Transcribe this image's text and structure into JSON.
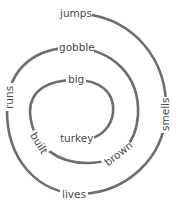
{
  "diagram": {
    "type": "word-spiral",
    "line_color": "#6e6e6e",
    "text_color": "#4a4a4a",
    "words_outer_to_inner": [
      "jumps",
      "smells",
      "lives",
      "runs",
      "gobble",
      "brown",
      "built",
      "big",
      "turkey"
    ],
    "labels": {
      "jumps": "jumps",
      "smells": "smells",
      "lives": "lives",
      "runs": "runs",
      "gobble": "gobble",
      "brown": "brown",
      "built": "built",
      "big": "big",
      "turkey": "turkey"
    }
  }
}
